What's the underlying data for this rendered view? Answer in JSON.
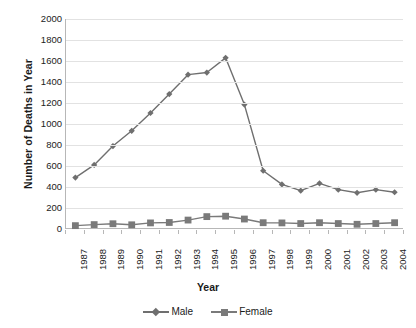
{
  "chart_data": {
    "type": "line",
    "title": "",
    "xlabel": "Year",
    "ylabel": "Number of Deaths in Year",
    "categories": [
      "1987",
      "1988",
      "1989",
      "1990",
      "1991",
      "1992",
      "1993",
      "1994",
      "1995",
      "1996",
      "1997",
      "1998",
      "1999",
      "2000",
      "2001",
      "2002",
      "2003",
      "2004"
    ],
    "ylim": [
      0,
      2000
    ],
    "ytick_step": 200,
    "yticks": [
      "2000",
      "1800",
      "1600",
      "1400",
      "1200",
      "1000",
      "800",
      "600",
      "400",
      "200",
      "0"
    ],
    "grid": "horizontal",
    "legend_position": "bottom",
    "series": [
      {
        "name": "Male",
        "marker": "diamond",
        "color": "#6f6f6f",
        "values": [
          490,
          610,
          790,
          935,
          1105,
          1285,
          1470,
          1490,
          1630,
          1185,
          555,
          425,
          365,
          435,
          375,
          345,
          375,
          350
        ]
      },
      {
        "name": "Female",
        "marker": "square",
        "color": "#7a7a7a",
        "values": [
          32,
          42,
          50,
          40,
          58,
          62,
          85,
          118,
          122,
          95,
          60,
          58,
          52,
          60,
          52,
          45,
          52,
          60
        ]
      }
    ]
  },
  "legend": {
    "items": [
      {
        "label": "Male"
      },
      {
        "label": "Female"
      }
    ]
  },
  "colors": {
    "male": "#6f6f6f",
    "female": "#7a7a7a",
    "grid": "#e2e2e2",
    "axis": "#b7b7b7",
    "text": "#1a1a1a",
    "background": "#ffffff"
  }
}
